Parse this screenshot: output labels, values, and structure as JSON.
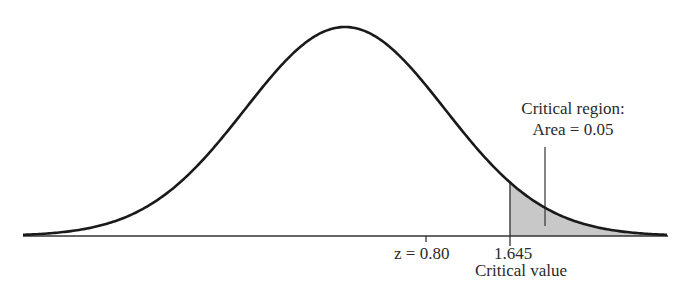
{
  "chart_data": {
    "type": "area",
    "title": "",
    "xlabel": "",
    "ylabel": "",
    "distribution": {
      "name": "standard normal",
      "mean": 0,
      "sd": 1
    },
    "markers": [
      {
        "label": "z = 0.80",
        "x": 0.8,
        "kind": "tick"
      },
      {
        "label": "1.645",
        "x": 1.645,
        "kind": "critical value line"
      }
    ],
    "shaded_region": {
      "from": 1.645,
      "to": "infinity",
      "area": 0.05,
      "color": "#c8c8c8"
    },
    "annotations": [
      "Critical region:",
      "Area = 0.05",
      "Critical value"
    ],
    "grid": false,
    "legend": null
  },
  "labels": {
    "region_line1": "Critical region:",
    "region_line2": "Area = 0.05",
    "z_label": "z = 0.80",
    "crit_number": "1.645",
    "crit_caption": "Critical value"
  },
  "colors": {
    "curve": "#1a1a1a",
    "shade": "#c8c8c8",
    "axis": "#333333"
  }
}
